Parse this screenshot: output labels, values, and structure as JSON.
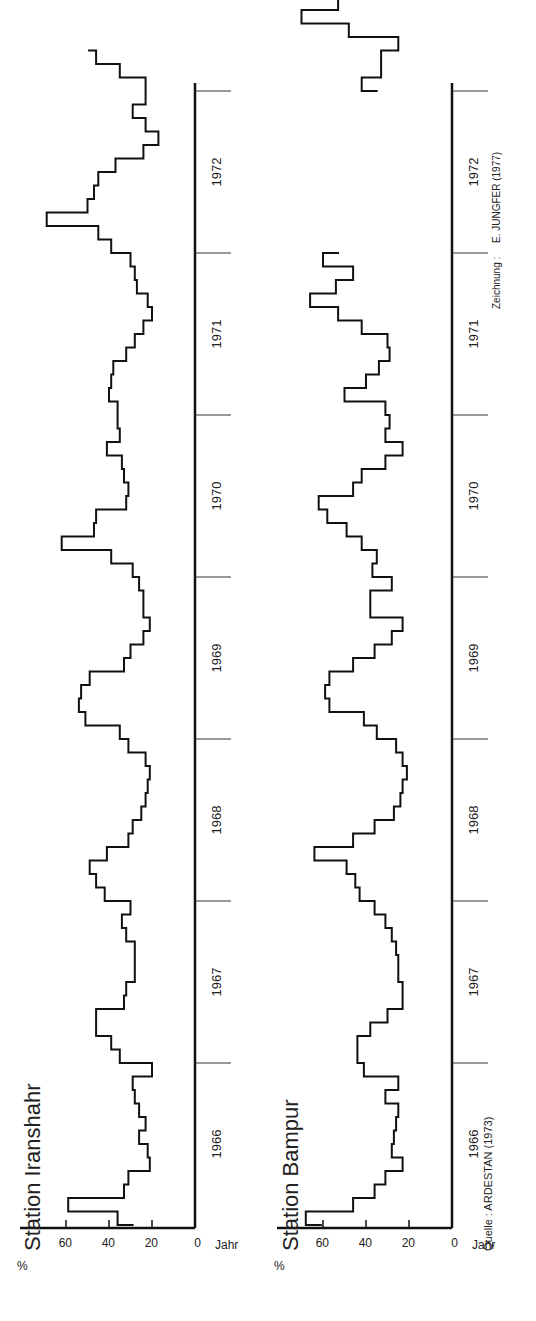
{
  "chart_data": [
    {
      "type": "line",
      "subtype": "step",
      "title": "Station Iranshahr",
      "xlabel": "Jahr",
      "ylabel": "%",
      "yticks": [
        0,
        20,
        40,
        60
      ],
      "ylim": [
        0,
        80
      ],
      "categories": [
        "1966",
        "1967",
        "1968",
        "1969",
        "1970",
        "1971",
        "1972"
      ],
      "resolution": "monthly",
      "values": [
        36,
        59,
        33,
        31,
        21,
        22,
        26,
        23,
        26,
        28,
        29,
        20,
        35,
        39,
        46,
        46,
        33,
        32,
        28,
        28,
        28,
        32,
        34,
        30,
        42,
        46,
        49,
        41,
        31,
        29,
        25,
        23,
        22,
        21,
        23,
        31,
        35,
        51,
        54,
        53,
        49,
        33,
        30,
        24,
        21,
        24,
        24,
        26,
        29,
        39,
        62,
        47,
        46,
        32,
        31,
        33,
        34,
        41,
        35,
        36,
        36,
        40,
        39,
        38,
        32,
        28,
        24,
        20,
        22,
        27,
        28,
        30,
        39,
        45,
        69,
        50,
        47,
        45,
        37,
        24,
        17,
        23,
        29,
        23,
        23,
        35,
        46
      ]
    },
    {
      "type": "line",
      "subtype": "step",
      "title": "Station Bampur",
      "xlabel": "Jahr",
      "ylabel": "%",
      "yticks": [
        0,
        20,
        40,
        60
      ],
      "ylim": [
        0,
        80
      ],
      "categories": [
        "1966",
        "1967",
        "1968",
        "1969",
        "1970",
        "1971",
        "1972"
      ],
      "resolution": "monthly",
      "values": [
        68,
        46,
        36,
        31,
        23,
        28,
        27,
        26,
        25,
        31,
        25,
        41,
        44,
        44,
        38,
        30,
        23,
        23,
        25,
        25,
        26,
        28,
        31,
        36,
        43,
        45,
        49,
        64,
        46,
        36,
        27,
        24,
        23,
        21,
        23,
        26,
        35,
        41,
        57,
        59,
        57,
        46,
        36,
        28,
        23,
        38,
        38,
        28,
        37,
        35,
        42,
        49,
        58,
        62,
        46,
        42,
        31,
        23,
        31,
        29,
        31,
        50,
        40,
        34,
        29,
        30,
        42,
        53,
        66,
        54,
        46,
        60,
        null,
        null,
        null,
        null,
        null,
        null,
        null,
        null,
        null,
        null,
        null,
        null,
        42,
        33,
        33,
        25,
        48,
        70,
        53,
        58,
        null,
        null,
        null,
        null,
        28,
        36,
        34,
        30,
        29,
        30,
        35,
        48,
        60
      ]
    }
  ],
  "charts": {
    "iranshahr": {
      "title": "Station Iranshahr"
    },
    "bampur": {
      "title": "Station Bampur"
    }
  },
  "axis": {
    "ylabel": "%",
    "xlabel": "Jahr",
    "yticks": [
      "0",
      "20",
      "40",
      "60"
    ],
    "years": [
      "1966",
      "1967",
      "1968",
      "1969",
      "1970",
      "1971",
      "1972"
    ]
  },
  "credits": {
    "source": "Quelle : ARDESTAN (1973)",
    "drawing_label": "Zeichnung :",
    "drawing_author": "E. JUNGFER (1977)"
  }
}
